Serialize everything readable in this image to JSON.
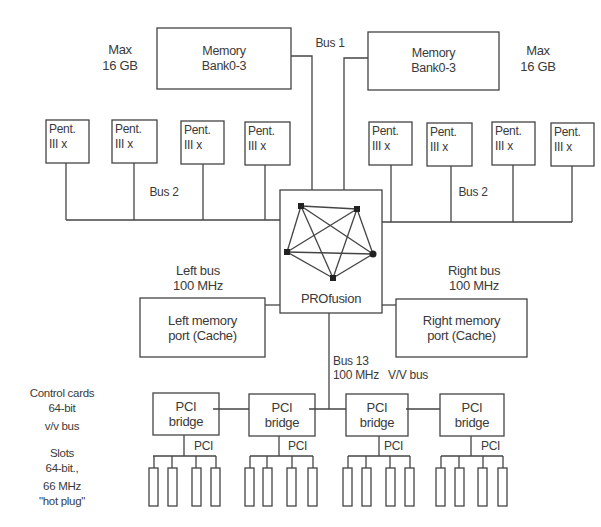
{
  "diagram": {
    "memory_left": {
      "line1": "Memory",
      "line2": "Bank0-3",
      "max_line1": "Max",
      "max_line2": "16 GB"
    },
    "memory_right": {
      "line1": "Memory",
      "line2": "Bank0-3",
      "max_line1": "Max",
      "max_line2": "16 GB"
    },
    "bus1_label": "Bus 1",
    "cpus_left": [
      {
        "line1": "Pent.",
        "line2": "III x"
      },
      {
        "line1": "Pent.",
        "line2": "III x"
      },
      {
        "line1": "Pent.",
        "line2": "III x"
      },
      {
        "line1": "Pent.",
        "line2": "III x"
      }
    ],
    "cpus_right": [
      {
        "line1": "Pent.",
        "line2": "III x"
      },
      {
        "line1": "Pent.",
        "line2": "III x"
      },
      {
        "line1": "Pent.",
        "line2": "III x"
      },
      {
        "line1": "Pent.",
        "line2": "III x"
      }
    ],
    "bus2_left_label": "Bus 2",
    "bus2_right_label": "Bus 2",
    "switch": {
      "label": "PROfusion"
    },
    "left_bus": {
      "line1": "Left bus",
      "line2": "100 MHz"
    },
    "right_bus": {
      "line1": "Right bus",
      "line2": "100 MHz"
    },
    "left_port": {
      "line1": "Left memory",
      "line2": "port (Cache)"
    },
    "right_port": {
      "line1": "Right memory",
      "line2": "port (Cache)"
    },
    "bus13": {
      "line1": "Bus 13",
      "line2": "100 MHz",
      "extra": "V/V bus"
    },
    "pci_bridges": [
      {
        "line1": "PCI",
        "line2": "bridge",
        "bus_label": "PCI"
      },
      {
        "line1": "PCI",
        "line2": "bridge",
        "bus_label": "PCI"
      },
      {
        "line1": "PCI",
        "line2": "bridge",
        "bus_label": "PCI"
      },
      {
        "line1": "PCI",
        "line2": "bridge",
        "bus_label": "PCI"
      }
    ],
    "side_notes": {
      "control_line1": "Control cards",
      "control_line2": "64-bit",
      "control_line3": "v/v bus",
      "slots_line1": "Slots",
      "slots_line2": "64-bit.,",
      "slots_line3": "66 MHz",
      "slots_line4": "\"hot plug\""
    },
    "colors": {
      "line": "#444444",
      "text": "#3a3a3a",
      "background": "#ffffff"
    }
  }
}
